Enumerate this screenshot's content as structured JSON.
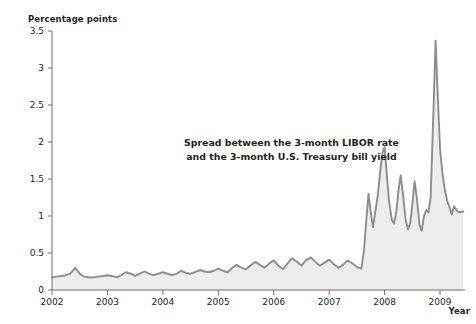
{
  "chart_data": {
    "type": "area",
    "title": "",
    "subtitle": "",
    "xlabel": "Year",
    "ylabel": "Percentage points",
    "xlim": [
      2002,
      2009.45
    ],
    "ylim": [
      0,
      3.5
    ],
    "grid": false,
    "legend_position": "none",
    "x_tick_labels": [
      "2002",
      "2003",
      "2004",
      "2005",
      "2006",
      "2007",
      "2008",
      "2009"
    ],
    "x_ticks": [
      2002,
      2003,
      2004,
      2005,
      2006,
      2007,
      2008,
      2009
    ],
    "y_tick_labels": [
      "0",
      "0.5",
      "1",
      "1.5",
      "2",
      "2.5",
      "3",
      "3.5"
    ],
    "y_ticks": [
      0,
      0.5,
      1,
      1.5,
      2,
      2.5,
      3,
      3.5
    ],
    "annotations": [
      {
        "name": "series-annotation",
        "line1": "Spread between the 3-month LIBOR rate",
        "line2": "and the 3-month U.S. Treasury bill yield"
      }
    ],
    "series": [
      {
        "name": "Spread between the 3-month LIBOR rate and the 3-month U.S. Treasury bill yield",
        "line_color": "#8d8d8d",
        "fill_color": "#ededed",
        "x": [
          2002.0,
          2002.08,
          2002.17,
          2002.25,
          2002.33,
          2002.42,
          2002.5,
          2002.58,
          2002.67,
          2002.75,
          2002.83,
          2002.92,
          2003.0,
          2003.08,
          2003.17,
          2003.25,
          2003.33,
          2003.42,
          2003.5,
          2003.58,
          2003.67,
          2003.75,
          2003.83,
          2003.92,
          2004.0,
          2004.08,
          2004.17,
          2004.25,
          2004.33,
          2004.42,
          2004.5,
          2004.58,
          2004.67,
          2004.75,
          2004.83,
          2004.92,
          2005.0,
          2005.08,
          2005.17,
          2005.25,
          2005.33,
          2005.42,
          2005.5,
          2005.58,
          2005.67,
          2005.75,
          2005.83,
          2005.92,
          2006.0,
          2006.08,
          2006.17,
          2006.25,
          2006.33,
          2006.42,
          2006.5,
          2006.58,
          2006.67,
          2006.75,
          2006.83,
          2006.92,
          2007.0,
          2007.08,
          2007.17,
          2007.25,
          2007.33,
          2007.42,
          2007.5,
          2007.58,
          2007.63,
          2007.67,
          2007.71,
          2007.75,
          2007.79,
          2007.83,
          2007.88,
          2007.92,
          2007.96,
          2008.0,
          2008.04,
          2008.08,
          2008.13,
          2008.17,
          2008.21,
          2008.25,
          2008.29,
          2008.33,
          2008.38,
          2008.42,
          2008.46,
          2008.5,
          2008.54,
          2008.58,
          2008.63,
          2008.67,
          2008.71,
          2008.75,
          2008.79,
          2008.83,
          2008.88,
          2008.92,
          2008.96,
          2009.0,
          2009.04,
          2009.08,
          2009.13,
          2009.17,
          2009.21,
          2009.25,
          2009.33,
          2009.42
        ],
        "values": [
          0.17,
          0.18,
          0.19,
          0.2,
          0.22,
          0.3,
          0.22,
          0.18,
          0.17,
          0.17,
          0.18,
          0.19,
          0.2,
          0.19,
          0.17,
          0.2,
          0.24,
          0.22,
          0.19,
          0.22,
          0.25,
          0.22,
          0.2,
          0.22,
          0.24,
          0.22,
          0.2,
          0.22,
          0.26,
          0.23,
          0.22,
          0.24,
          0.27,
          0.25,
          0.24,
          0.26,
          0.29,
          0.26,
          0.24,
          0.3,
          0.34,
          0.3,
          0.28,
          0.33,
          0.38,
          0.34,
          0.3,
          0.36,
          0.4,
          0.33,
          0.28,
          0.36,
          0.43,
          0.38,
          0.33,
          0.4,
          0.44,
          0.38,
          0.33,
          0.37,
          0.41,
          0.35,
          0.3,
          0.34,
          0.4,
          0.36,
          0.31,
          0.29,
          0.55,
          0.95,
          1.3,
          1.05,
          0.85,
          1.05,
          1.3,
          1.6,
          1.85,
          1.93,
          1.55,
          1.2,
          0.95,
          0.9,
          1.05,
          1.35,
          1.55,
          1.3,
          0.95,
          0.82,
          0.9,
          1.15,
          1.47,
          1.25,
          0.88,
          0.8,
          1.0,
          1.08,
          1.05,
          1.25,
          2.4,
          3.37,
          2.6,
          1.9,
          1.6,
          1.38,
          1.2,
          1.12,
          1.02,
          1.13,
          1.05,
          1.06
        ]
      }
    ]
  }
}
